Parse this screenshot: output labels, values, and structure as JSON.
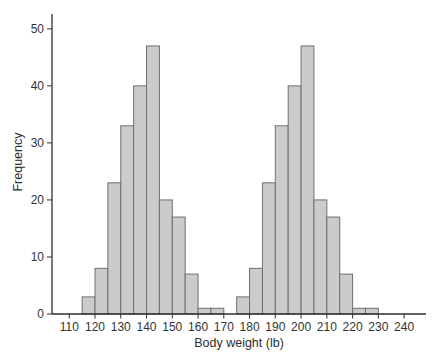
{
  "figure": {
    "xlabel": "Body weight (lb)",
    "ylabel": "Frequency"
  },
  "colors": {
    "background": "#ffffff",
    "bar_fill": "#cbcbcb",
    "bar_stroke": "#6f6f6f",
    "axis": "#2f2f2f",
    "tick_text": "#333333"
  },
  "chart_data": {
    "type": "bar",
    "subtype": "histogram",
    "title": "",
    "xlabel": "Body weight (lb)",
    "ylabel": "Frequency",
    "grid": false,
    "legend": null,
    "bin_width": 5,
    "bins": [
      {
        "start": 115,
        "end": 120,
        "count": 3
      },
      {
        "start": 120,
        "end": 125,
        "count": 8
      },
      {
        "start": 125,
        "end": 130,
        "count": 23
      },
      {
        "start": 130,
        "end": 135,
        "count": 33
      },
      {
        "start": 135,
        "end": 140,
        "count": 40
      },
      {
        "start": 140,
        "end": 145,
        "count": 47
      },
      {
        "start": 145,
        "end": 150,
        "count": 20
      },
      {
        "start": 150,
        "end": 155,
        "count": 17
      },
      {
        "start": 155,
        "end": 160,
        "count": 7
      },
      {
        "start": 160,
        "end": 165,
        "count": 1
      },
      {
        "start": 165,
        "end": 170,
        "count": 1
      },
      {
        "start": 170,
        "end": 175,
        "count": 0
      },
      {
        "start": 175,
        "end": 180,
        "count": 3
      },
      {
        "start": 180,
        "end": 185,
        "count": 8
      },
      {
        "start": 185,
        "end": 190,
        "count": 23
      },
      {
        "start": 190,
        "end": 195,
        "count": 33
      },
      {
        "start": 195,
        "end": 200,
        "count": 40
      },
      {
        "start": 200,
        "end": 205,
        "count": 47
      },
      {
        "start": 205,
        "end": 210,
        "count": 20
      },
      {
        "start": 210,
        "end": 215,
        "count": 17
      },
      {
        "start": 215,
        "end": 220,
        "count": 7
      },
      {
        "start": 220,
        "end": 225,
        "count": 1
      },
      {
        "start": 225,
        "end": 230,
        "count": 1
      }
    ],
    "x_ticks": [
      110,
      120,
      130,
      140,
      150,
      160,
      170,
      180,
      190,
      200,
      210,
      220,
      230,
      240
    ],
    "y_ticks": [
      0,
      10,
      20,
      30,
      40,
      50
    ],
    "xlim": [
      103.3,
      248.5
    ],
    "ylim": [
      0,
      52.6
    ]
  }
}
